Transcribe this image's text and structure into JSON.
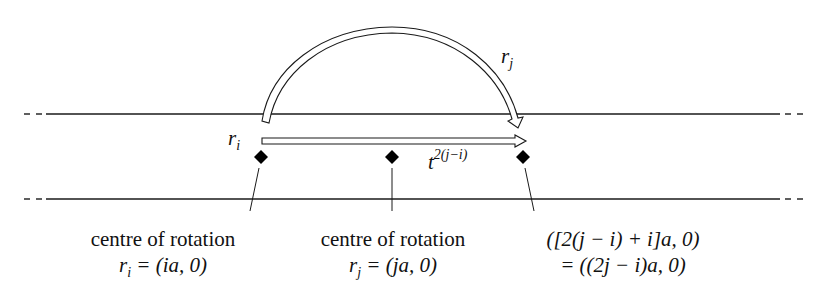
{
  "diagram": {
    "labels": {
      "arc_label": "r",
      "arc_label_sub": "j",
      "left_label": "r",
      "left_label_sub": "i",
      "translation_label": "t",
      "translation_label_sup": "2(j−i)"
    },
    "captions": [
      {
        "title": "centre of rotation",
        "formula_var": "r",
        "formula_sub": "i",
        "formula_rest": " = (ia, 0)"
      },
      {
        "title": "centre of rotation",
        "formula_var": "r",
        "formula_sub": "j",
        "formula_rest": " = (ja, 0)"
      },
      {
        "line1": "([2(j − i) + i]a, 0)",
        "line2": "= ((2j − i)a, 0)"
      }
    ],
    "points": [
      {
        "name": "centre-ri",
        "x": 261,
        "y": 157
      },
      {
        "name": "centre-rj",
        "x": 392,
        "y": 157
      },
      {
        "name": "image-point",
        "x": 523,
        "y": 157
      }
    ],
    "strip": {
      "upper_y": 114,
      "lower_y": 199
    },
    "colors": {
      "stroke": "#1a1a1a",
      "fill": "#ffffff",
      "diamond": "#000000"
    }
  }
}
